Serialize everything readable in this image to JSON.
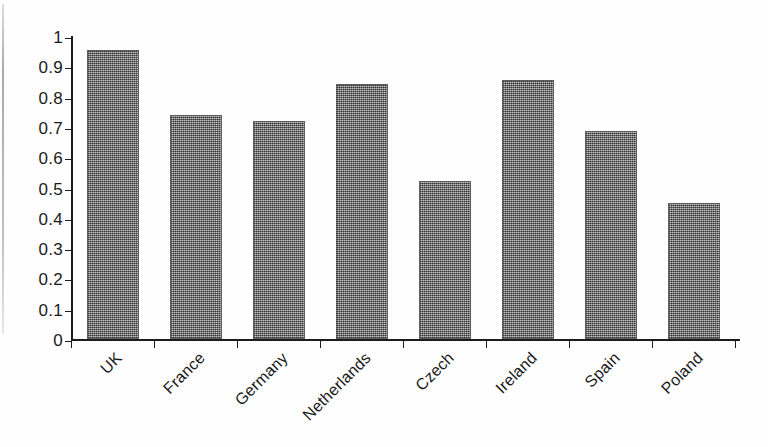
{
  "chart_data": {
    "type": "bar",
    "title": "",
    "subtitle": "",
    "xlabel": "",
    "ylabel": "",
    "categories": [
      "UK",
      "France",
      "Germany",
      "Netherlands",
      "Czech",
      "Ireland",
      "Spain",
      "Poland"
    ],
    "values": [
      0.955,
      0.74,
      0.72,
      0.84,
      0.52,
      0.855,
      0.685,
      0.45
    ],
    "series": [
      {
        "name": "",
        "values": [
          0.955,
          0.74,
          0.72,
          0.84,
          0.52,
          0.855,
          0.685,
          0.45
        ]
      }
    ],
    "ylim": [
      0,
      1
    ],
    "ytick_labels": [
      "0",
      "0.1",
      "0.2",
      "0.3",
      "0.4",
      "0.5",
      "0.6",
      "0.7",
      "0.8",
      "0.9",
      "1"
    ],
    "ytick_values": [
      0,
      0.1,
      0.2,
      0.3,
      0.4,
      0.5,
      0.6,
      0.7,
      0.8,
      0.9,
      1
    ],
    "grid": false,
    "legend": false,
    "legend_position": "none",
    "bar_color": "#7d7d7d",
    "axis_color": "#1c1c1c",
    "background_color": "#ffffff",
    "xtick_label_rotation": -45,
    "annotations": []
  }
}
